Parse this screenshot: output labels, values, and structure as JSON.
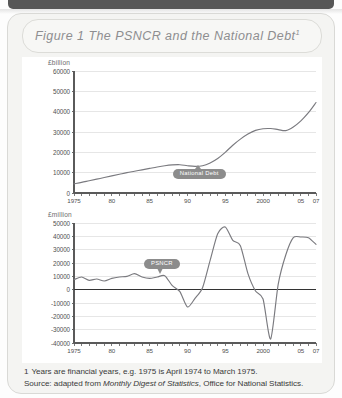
{
  "figure": {
    "title": "Figure 1  The PSNCR and the National Debt",
    "title_superscript": "1"
  },
  "notes": {
    "footnote_marker": "1",
    "footnote": "Years are financial years, e.g. 1975 is April 1974 to March 1975.",
    "source_prefix": "Source: adapted from ",
    "source_italic": "Monthly Digest of Statistics",
    "source_suffix": ", Office for National Statistics."
  },
  "colors": {
    "card_bg": "#f4f4f2",
    "panel_bg": "#ffffff",
    "line": "#7a7a7f",
    "axis": "#5a5a5a",
    "grid": "#dcdcdc",
    "pill": "#8c8c8c",
    "title_text": "#8e8e90"
  },
  "chart_data": [
    {
      "id": "national-debt",
      "type": "line",
      "title": "National Debt",
      "ylabel": "£billion",
      "xlabel": "",
      "ylim": [
        0,
        60000
      ],
      "ytick_labels": [
        "60000",
        "50000",
        "40000",
        "30000",
        "20000",
        "10000",
        "0"
      ],
      "ytick_values": [
        60000,
        50000,
        40000,
        30000,
        20000,
        10000,
        0
      ],
      "xlim": [
        1975,
        2007
      ],
      "xtick_labels": [
        "1975",
        "80",
        "85",
        "90",
        "95",
        "2000",
        "05",
        "07"
      ],
      "xtick_values": [
        1975,
        1980,
        1985,
        1990,
        1995,
        2000,
        2005,
        2007
      ],
      "grid": true,
      "annotation": "National Debt",
      "series": [
        {
          "name": "National Debt",
          "x": [
            1975,
            1976,
            1977,
            1978,
            1979,
            1980,
            1981,
            1982,
            1983,
            1984,
            1985,
            1986,
            1987,
            1988,
            1989,
            1990,
            1991,
            1992,
            1993,
            1994,
            1995,
            1996,
            1997,
            1998,
            1999,
            2000,
            2001,
            2002,
            2003,
            2004,
            2005,
            2006,
            2007
          ],
          "values": [
            4500,
            5200,
            6000,
            6800,
            7600,
            8400,
            9200,
            10000,
            10700,
            11400,
            12100,
            12800,
            13400,
            13800,
            13900,
            13400,
            13100,
            13400,
            14800,
            17000,
            20000,
            23500,
            26500,
            29000,
            30800,
            31600,
            31700,
            31200,
            30700,
            32500,
            35500,
            39500,
            44500
          ]
        }
      ]
    },
    {
      "id": "psncr",
      "type": "line",
      "title": "PSNCR",
      "ylabel": "£million",
      "xlabel": "",
      "ylim": [
        -40000,
        50000
      ],
      "ytick_labels": [
        "50000",
        "40000",
        "30000",
        "20000",
        "10000",
        "0",
        "-10000",
        "-20000",
        "-30000",
        "-40000"
      ],
      "ytick_values": [
        50000,
        40000,
        30000,
        20000,
        10000,
        0,
        -10000,
        -20000,
        -30000,
        -40000
      ],
      "xlim": [
        1975,
        2007
      ],
      "xtick_labels": [
        "1975",
        "80",
        "85",
        "90",
        "95",
        "2000",
        "05",
        "07"
      ],
      "xtick_values": [
        1975,
        1980,
        1985,
        1990,
        1995,
        2000,
        2005,
        2007
      ],
      "grid": true,
      "zero_line": true,
      "annotation": "PSNCR",
      "series": [
        {
          "name": "PSNCR",
          "x": [
            1975,
            1976,
            1977,
            1978,
            1979,
            1980,
            1981,
            1982,
            1983,
            1984,
            1985,
            1986,
            1987,
            1988,
            1989,
            1990,
            1991,
            1992,
            1993,
            1994,
            1995,
            1996,
            1997,
            1998,
            1999,
            2000,
            2001,
            2002,
            2003,
            2004,
            2005,
            2006,
            2007
          ],
          "values": [
            7500,
            9500,
            7000,
            8000,
            6500,
            8500,
            9500,
            10000,
            12000,
            9500,
            8500,
            9500,
            10500,
            3000,
            -1500,
            -13000,
            -6500,
            1500,
            22000,
            42000,
            47000,
            37000,
            33000,
            12000,
            -1000,
            -7000,
            -37000,
            4000,
            26000,
            39000,
            39500,
            39000,
            34000
          ]
        }
      ]
    }
  ]
}
